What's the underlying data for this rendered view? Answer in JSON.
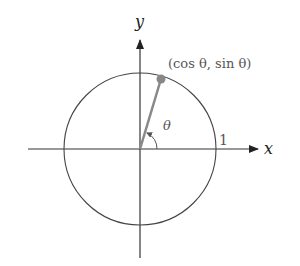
{
  "diagram": {
    "axes": {
      "x_label": "x",
      "y_label": "y"
    },
    "point_label": "(cos θ, sin θ)",
    "angle_label": "θ",
    "radius_label": "1",
    "colors": {
      "axis": "#222222",
      "circle": "#444444",
      "radius": "#888888",
      "point": "#888888",
      "label": "#666666"
    }
  }
}
